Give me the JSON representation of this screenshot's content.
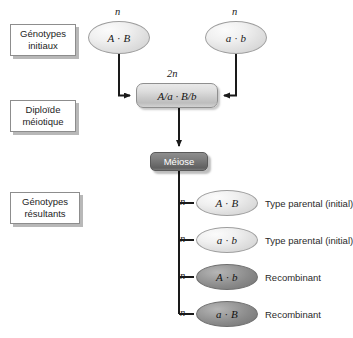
{
  "figure": {
    "language": "fr",
    "background_color": "#ffffff",
    "stage_labels": [
      {
        "id": "initial",
        "line1": "Génotypes",
        "line2": "initiaux"
      },
      {
        "id": "diploid",
        "line1": "Diploïde",
        "line2": "méiotique"
      },
      {
        "id": "resulting",
        "line1": "Génotypes",
        "line2": "résultants"
      }
    ],
    "parents": [
      {
        "id": "parent-left",
        "genotype": "A · B",
        "ploidy": "n",
        "shade": "light"
      },
      {
        "id": "parent-right",
        "genotype": "a · b",
        "ploidy": "n",
        "shade": "light"
      }
    ],
    "diploid": {
      "genotype": "A/a · B/b",
      "ploidy": "2n"
    },
    "process": {
      "label": "Méiose",
      "box_color": "#6b6b6b",
      "text_color": "#ffffff"
    },
    "products": [
      {
        "id": "gamete-1",
        "genotype": "A · B",
        "ploidy": "n",
        "shade": "light",
        "outcome": "Type parental (initial)"
      },
      {
        "id": "gamete-2",
        "genotype": "a · b",
        "ploidy": "n",
        "shade": "light",
        "outcome": "Type parental (initial)"
      },
      {
        "id": "gamete-3",
        "genotype": "A · b",
        "ploidy": "n",
        "shade": "dark",
        "outcome": "Recombinant"
      },
      {
        "id": "gamete-4",
        "genotype": "a · B",
        "ploidy": "n",
        "shade": "dark",
        "outcome": "Recombinant"
      }
    ]
  }
}
